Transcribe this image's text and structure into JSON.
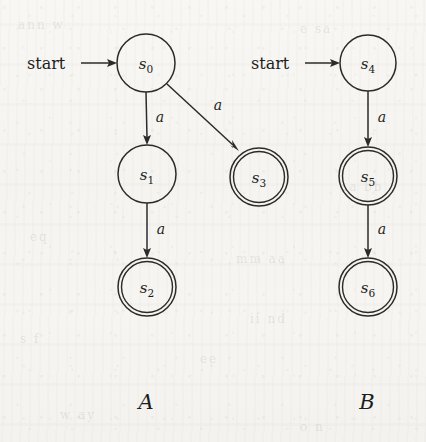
{
  "figure": {
    "background_color": "#f6f5f1",
    "ink_color": "#2b2b2b",
    "ghost_texts": [
      "ann w",
      "e sa",
      "eq",
      "mm aa",
      "s f",
      "ii nd",
      "w ay",
      "o n",
      "ee",
      "aa bb"
    ]
  },
  "automata": [
    {
      "id": "A",
      "name": "A",
      "start_label": "start",
      "states": [
        {
          "id": "s0",
          "label": "s",
          "subscript": "0",
          "accepting": false,
          "cx": 146,
          "cy": 63,
          "r": 29
        },
        {
          "id": "s1",
          "label": "s",
          "subscript": "1",
          "accepting": false,
          "cx": 147,
          "cy": 174,
          "r": 29
        },
        {
          "id": "s2",
          "label": "s",
          "subscript": "2",
          "accepting": true,
          "cx": 147,
          "cy": 287,
          "r": 29
        },
        {
          "id": "s3",
          "label": "s",
          "subscript": "3",
          "accepting": true,
          "cx": 259,
          "cy": 177,
          "r": 29
        }
      ],
      "transitions": [
        {
          "from": "s0",
          "to": "s1",
          "label": "a",
          "label_x": 160,
          "label_y": 122
        },
        {
          "from": "s0",
          "to": "s3",
          "label": "a",
          "label_x": 218,
          "label_y": 110
        },
        {
          "from": "s1",
          "to": "s2",
          "label": "a",
          "label_x": 161,
          "label_y": 234
        }
      ],
      "start_label_x": 27,
      "start_label_y": 69,
      "name_x": 146,
      "name_y": 409
    },
    {
      "id": "B",
      "name": "B",
      "start_label": "start",
      "states": [
        {
          "id": "s4",
          "label": "s",
          "subscript": "4",
          "accepting": false,
          "cx": 368,
          "cy": 63,
          "r": 28
        },
        {
          "id": "s5",
          "label": "s",
          "subscript": "5",
          "accepting": true,
          "cx": 368,
          "cy": 176,
          "r": 29
        },
        {
          "id": "s6",
          "label": "s",
          "subscript": "6",
          "accepting": true,
          "cx": 368,
          "cy": 287,
          "r": 29
        }
      ],
      "transitions": [
        {
          "from": "s4",
          "to": "s5",
          "label": "a",
          "label_x": 382,
          "label_y": 122
        },
        {
          "from": "s5",
          "to": "s6",
          "label": "a",
          "label_x": 382,
          "label_y": 234
        }
      ],
      "start_label_x": 251,
      "start_label_y": 69,
      "name_x": 367,
      "name_y": 409
    }
  ]
}
